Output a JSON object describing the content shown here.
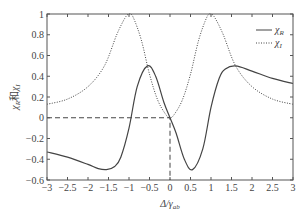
{
  "chart_data": {
    "type": "line",
    "title": "",
    "xlabel": "Δ/γ_ab",
    "ylabel": "χ_R 和 χ_I",
    "xlim": [
      -3,
      3
    ],
    "ylim": [
      -0.6,
      1
    ],
    "xticks": [
      "-3",
      "-2.5",
      "-2",
      "-1.5",
      "-1",
      "-0.5",
      "0",
      "0.5",
      "1",
      "1.5",
      "2",
      "2.5",
      "3"
    ],
    "yticks": [
      "-0.6",
      "-0.4",
      "-0.2",
      "0",
      "0.2",
      "0.4",
      "0.6",
      "0.8",
      "1"
    ],
    "grid": false,
    "legend_position": "upper right",
    "series": [
      {
        "name": "χ_R",
        "style": "solid",
        "x": [
          -3,
          -2.5,
          -2,
          -1.75,
          -1.55,
          -1.35,
          -1.2,
          -1,
          -0.8,
          -0.55,
          -0.35,
          -0.15,
          0,
          0.15,
          0.35,
          0.55,
          0.8,
          1,
          1.2,
          1.35,
          1.6,
          2,
          2.5,
          3
        ],
        "y": [
          -0.33,
          -0.38,
          -0.45,
          -0.49,
          -0.5,
          -0.47,
          -0.38,
          -0.1,
          0.3,
          0.5,
          0.4,
          0.15,
          0,
          -0.15,
          -0.4,
          -0.5,
          -0.3,
          0.1,
          0.38,
          0.47,
          0.5,
          0.45,
          0.38,
          0.33
        ]
      },
      {
        "name": "χ_I",
        "style": "dotted",
        "x": [
          -3,
          -2.5,
          -2,
          -1.6,
          -1.3,
          -1.1,
          -1,
          -0.9,
          -0.7,
          -0.5,
          -0.3,
          -0.1,
          0,
          0.1,
          0.3,
          0.5,
          0.7,
          0.9,
          1,
          1.1,
          1.3,
          1.6,
          2,
          2.5,
          3
        ],
        "y": [
          0.13,
          0.18,
          0.3,
          0.5,
          0.8,
          0.96,
          1,
          0.97,
          0.75,
          0.42,
          0.17,
          0.03,
          0,
          0.03,
          0.17,
          0.42,
          0.75,
          0.97,
          1,
          0.96,
          0.8,
          0.5,
          0.3,
          0.18,
          0.13
        ]
      }
    ],
    "annotations": [
      {
        "type": "dashed-guide",
        "from": [
          -3,
          0
        ],
        "via": [
          0,
          0
        ],
        "to": [
          0,
          -0.6
        ]
      }
    ]
  },
  "legend": {
    "r": "χ",
    "r_sub": "R",
    "i": "χ",
    "i_sub": "I"
  },
  "axis": {
    "xlabel_main": "Δ/γ",
    "xlabel_sub": "ab",
    "ylabel_a": "χ",
    "ylabel_a_sub": "R",
    "ylabel_mid": "和",
    "ylabel_b": "χ",
    "ylabel_b_sub": "I"
  }
}
